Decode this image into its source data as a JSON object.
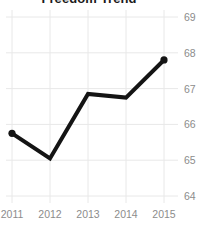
{
  "chart_data": {
    "type": "line",
    "title": "Freedom Trend",
    "xlabel": "",
    "ylabel": "",
    "categories": [
      "2011",
      "2012",
      "2013",
      "2014",
      "2015"
    ],
    "x": [
      2011,
      2012,
      2013,
      2014,
      2015
    ],
    "values": [
      65.75,
      65.05,
      66.85,
      66.75,
      67.8
    ],
    "series": [
      {
        "name": "Freedom Score",
        "values": [
          65.75,
          65.05,
          66.85,
          66.75,
          67.8
        ]
      }
    ],
    "ylim": [
      64,
      69
    ],
    "yticks": [
      64,
      65,
      66,
      67,
      68,
      69
    ],
    "ytick_labels": [
      "64",
      "65",
      "66",
      "67",
      "68",
      "69"
    ],
    "xtick_labels": [
      "2011",
      "2012",
      "2013",
      "2014",
      "2015"
    ],
    "y_axis_position": "right",
    "grid": true,
    "grid_color": "#e8e8e8",
    "legend": false,
    "legend_position": "none",
    "line_color": "#141414",
    "line_width": 4,
    "marker": "circle",
    "markers_at": [
      "2011",
      "2015"
    ],
    "background_color": "#ffffff",
    "tick_label_color": "#8c8c8c",
    "title_color": "#1a1a1a"
  }
}
